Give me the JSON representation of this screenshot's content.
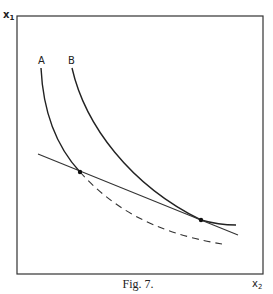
{
  "figure": {
    "caption": "Fig. 7.",
    "y_axis_label": "x",
    "y_axis_subscript": "1",
    "x_axis_label": "x",
    "x_axis_subscript": "2",
    "curves": [
      {
        "label": "A",
        "style": "solid",
        "description": "indifference curve A (continues as dashed below tangency)"
      },
      {
        "label": "B",
        "style": "solid",
        "description": "indifference curve B"
      }
    ],
    "budget_line": {
      "style": "solid"
    },
    "points": [
      {
        "name": "intersection-A",
        "on": "A"
      },
      {
        "name": "tangency-B",
        "on": "B"
      }
    ]
  },
  "colors": {
    "ink": "#222222",
    "background": "#ffffff"
  }
}
